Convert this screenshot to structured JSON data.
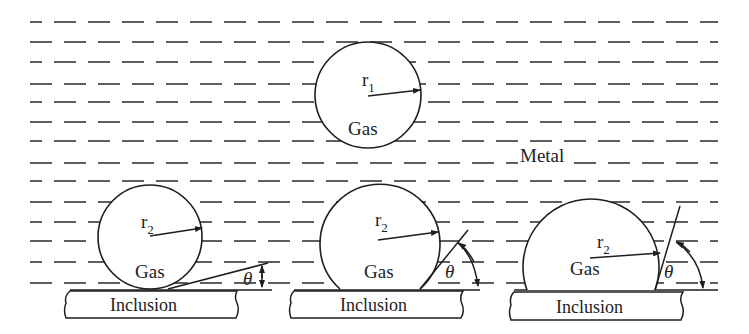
{
  "diagram": {
    "medium_label": "Metal",
    "top_bubble": {
      "radius_label": "r",
      "radius_sub": "1",
      "content_label": "Gas"
    },
    "bubbles": [
      {
        "radius_label": "r",
        "radius_sub": "2",
        "content_label": "Gas",
        "angle_label": "θ",
        "substrate_label": "Inclusion",
        "contact": "small-angle"
      },
      {
        "radius_label": "r",
        "radius_sub": "2",
        "content_label": "Gas",
        "angle_label": "θ",
        "substrate_label": "Inclusion",
        "contact": "medium-angle"
      },
      {
        "radius_label": "r",
        "radius_sub": "2",
        "content_label": "Gas",
        "angle_label": "θ",
        "substrate_label": "Inclusion",
        "contact": "large-angle"
      }
    ],
    "colors": {
      "ink": "#1e1e1e",
      "background": "#ffffff"
    }
  }
}
